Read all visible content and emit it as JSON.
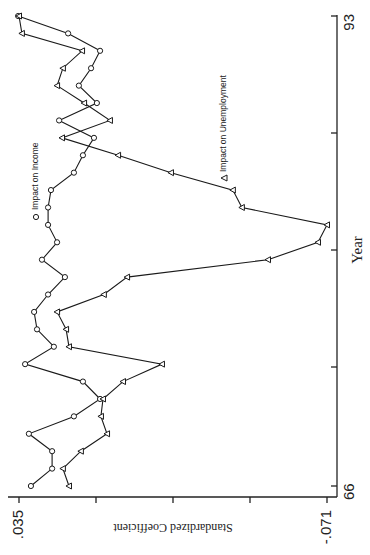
{
  "chart_data": {
    "type": "line",
    "orientation": "rotated-90-ccw",
    "title": "",
    "xlabel": "Year",
    "ylabel": "Standardized Coefficient",
    "x_tick_labels": [
      "66",
      "93"
    ],
    "y_tick_labels": [
      ".035",
      "-.071"
    ],
    "ylim": [
      -0.071,
      0.035
    ],
    "xlim": [
      66,
      93
    ],
    "grid": false,
    "legend_position": "inside",
    "x": [
      66,
      67,
      68,
      69,
      70,
      71,
      72,
      73,
      74,
      75,
      76,
      77,
      78,
      79,
      80,
      81,
      82,
      83,
      84,
      85,
      86,
      87,
      88,
      89,
      90,
      91,
      92,
      93
    ],
    "series": [
      {
        "name": "Impact on Income",
        "marker": "circle",
        "values": [
          0.0309,
          0.0236,
          0.0236,
          0.0316,
          0.0161,
          0.0071,
          0.013,
          0.0329,
          0.023,
          0.0288,
          0.0298,
          0.025,
          0.0192,
          0.0271,
          0.0219,
          0.025,
          0.025,
          0.024,
          0.0161,
          0.013,
          0.0092,
          0.0212,
          0.0082,
          0.0144,
          0.0102,
          0.0071,
          0.0181,
          0.0353
        ]
      },
      {
        "name": "Impact on Unemployment",
        "marker": "triangle",
        "values": [
          0.0178,
          0.0199,
          0.0137,
          0.0047,
          0.0068,
          0.0061,
          -0.0008,
          -0.0142,
          0.0178,
          0.0188,
          0.0219,
          0.0058,
          -0.0022,
          -0.0507,
          -0.0679,
          -0.071,
          -0.0417,
          -0.0386,
          -0.0173,
          0.0009,
          0.0202,
          0.0037,
          0.0126,
          0.0219,
          0.0199,
          0.0133,
          0.034,
          0.035
        ]
      }
    ]
  },
  "axes": {
    "year_label": "Year",
    "year_start": "66",
    "year_end": "93",
    "coef_label": "Standardized Coefficient",
    "coef_max": ".035",
    "coef_min": "-.071"
  },
  "legend": {
    "income_symbol": "O",
    "income_label": "Impact on Income",
    "unemp_symbol": "Δ",
    "unemp_label": "Impact on Unemployment"
  }
}
